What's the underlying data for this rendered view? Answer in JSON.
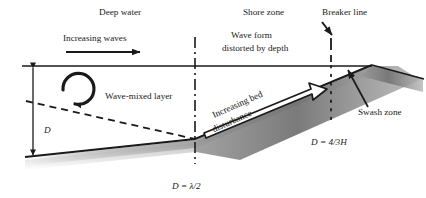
{
  "figure": {
    "background_color": "#ffffff",
    "line_color": "#1a1a1a",
    "bed_shadow_color": "#8c8c8c"
  },
  "zones": {
    "deep_water": "Deep water",
    "shore_zone": "Shore zone",
    "breaker_line": "Breaker line",
    "swash_zone": "Swash zone"
  },
  "annotations": {
    "increasing_waves": "Increasing waves",
    "wave_form_line1": "Wave form",
    "wave_form_line2": "distorted by depth",
    "wave_mixed_layer": "Wave-mixed layer",
    "increasing_bed_line1": "Increasing bed",
    "increasing_bed_line2": "disturbance"
  },
  "dimensions": {
    "depth_symbol": "D"
  },
  "equations": {
    "half_wavelength": "D = λ/2",
    "breaker_depth": "D = 4/3H"
  }
}
